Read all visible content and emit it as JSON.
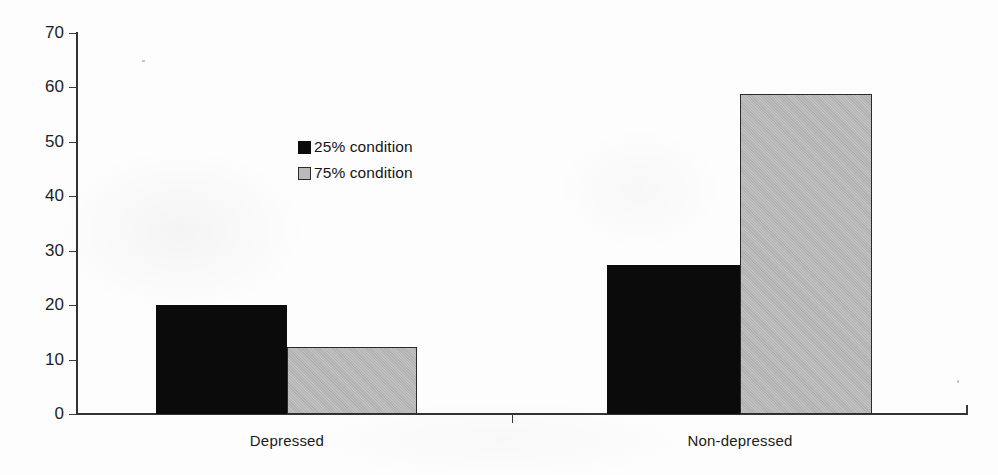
{
  "chart_data": {
    "type": "bar",
    "title": "",
    "subtitle": "",
    "xlabel": "",
    "ylabel": "",
    "categories": [
      "Depressed",
      "Non-depressed"
    ],
    "series": [
      {
        "name": "25% condition",
        "color": "#0b0b0b",
        "values": [
          20.0,
          27.4
        ]
      },
      {
        "name": "75% condition",
        "color": "#bababa",
        "values": [
          12.3,
          58.8
        ]
      }
    ],
    "ylim": [
      0,
      70
    ],
    "ytick_step": 10,
    "yticks": [
      0,
      10,
      20,
      30,
      40,
      50,
      60,
      70
    ],
    "ytick_labels": [
      "0",
      "10",
      "20",
      "30",
      "40",
      "50",
      "60",
      "70"
    ],
    "grid": false,
    "legend_position": "inside-upper-left",
    "annotations": []
  },
  "legend": {
    "entries": [
      {
        "label": "25% condition",
        "swatch": "filled-black-square"
      },
      {
        "label": "75% condition",
        "swatch": "outlined-gray-square"
      }
    ]
  },
  "axes": {
    "y": {
      "labels": [
        "70",
        "60",
        "50",
        "40",
        "30",
        "20",
        "10",
        "0"
      ]
    },
    "x": {
      "labels": [
        "Depressed",
        "Non-depressed"
      ]
    }
  },
  "colors": {
    "series_dark": "#0b0b0b",
    "series_light": "#bababa",
    "axis": "#333333",
    "text": "#1b1b1b",
    "background": "#ffffff"
  }
}
